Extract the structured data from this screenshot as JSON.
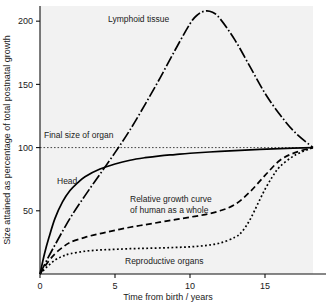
{
  "chart_data": {
    "type": "line",
    "title": "",
    "xlabel": "Time from birth / years",
    "ylabel": "Size attained as percentage of total postnatal growth",
    "xlim": [
      0,
      18.2
    ],
    "ylim": [
      0,
      212
    ],
    "xticks": [
      0,
      5,
      10,
      15
    ],
    "xtick_labels": [
      "0",
      "5",
      "10",
      "15"
    ],
    "yticks": [
      50,
      100,
      150,
      200
    ],
    "ytick_labels": [
      "50",
      "100",
      "150",
      "200"
    ],
    "grid": false,
    "legend_position": "inline-labels",
    "annotations": [
      {
        "text": "Final size of organ",
        "x": 0.4,
        "y": 108,
        "note": "label for dotted 100% reference line"
      },
      {
        "text": "Lymphoid tissue",
        "x": 5.2,
        "y": 196
      },
      {
        "text": "Head",
        "x": 1.6,
        "y": 78
      },
      {
        "text": "Relative growth curve",
        "x": 6.4,
        "y": 62
      },
      {
        "text": "of human as a whole",
        "x": 6.4,
        "y": 55
      },
      {
        "text": "Reproductive organs",
        "x": 6.3,
        "y": 10
      }
    ],
    "reference_lines": [
      {
        "label": "Final size of organ",
        "y": 100,
        "style": "dotted",
        "orientation": "horizontal"
      }
    ],
    "series": [
      {
        "name": "Head",
        "style": "solid",
        "x": [
          0,
          0.3,
          0.6,
          1,
          1.5,
          2,
          2.5,
          3,
          4,
          5,
          6,
          7,
          8,
          9,
          10,
          12,
          14,
          16,
          18.2
        ],
        "values": [
          0,
          16,
          29,
          44,
          57,
          66,
          72,
          77,
          83,
          87,
          90,
          92,
          93.5,
          94.5,
          95.5,
          97,
          98.2,
          99.2,
          100
        ]
      },
      {
        "name": "Lymphoid tissue",
        "style": "dash-dot",
        "x": [
          0,
          0.5,
          1,
          2,
          3,
          4,
          5,
          6,
          7,
          8,
          9,
          10,
          10.5,
          11,
          11.5,
          12,
          13,
          14,
          15,
          16,
          17,
          18.2
        ],
        "values": [
          0,
          12,
          23,
          44,
          62,
          79,
          96,
          114,
          134,
          155,
          177,
          198,
          205,
          208,
          207,
          202,
          185,
          164,
          143,
          126,
          112,
          100
        ]
      },
      {
        "name": "Relative growth curve of human as a whole",
        "style": "dashed",
        "x": [
          0,
          0.5,
          1,
          1.5,
          2,
          3,
          4,
          5,
          6,
          7,
          8,
          9,
          10,
          11,
          12,
          13,
          14,
          15,
          16,
          17,
          18.2
        ],
        "values": [
          0,
          9,
          16,
          21,
          25,
          29,
          32,
          34.5,
          37,
          39,
          41,
          43,
          45,
          47,
          50,
          55,
          65,
          78,
          90,
          96,
          100
        ]
      },
      {
        "name": "Reproductive organs",
        "style": "dotted",
        "x": [
          0,
          0.5,
          1,
          1.5,
          2,
          3,
          4,
          5,
          6,
          7,
          8,
          9,
          10,
          11,
          12,
          13,
          13.5,
          14,
          14.5,
          15,
          15.5,
          16,
          17,
          18.2
        ],
        "values": [
          0,
          6,
          11,
          14,
          16,
          18,
          19,
          19.5,
          20,
          20.3,
          20.6,
          21,
          21.5,
          22.5,
          24.5,
          29,
          34,
          43,
          55,
          67,
          77,
          85,
          94,
          100
        ]
      }
    ]
  }
}
